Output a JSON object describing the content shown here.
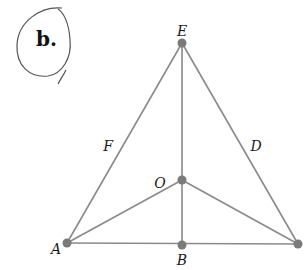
{
  "figure": {
    "tag": "b.",
    "points": [
      {
        "id": "E",
        "label": "E",
        "x": 182,
        "y": 43,
        "lx": 182,
        "ly": 34
      },
      {
        "id": "O",
        "label": "O",
        "x": 182,
        "y": 180,
        "lx": 160,
        "ly": 188
      },
      {
        "id": "B",
        "label": "B",
        "x": 182,
        "y": 245,
        "lx": 182,
        "ly": 266
      },
      {
        "id": "A",
        "label": "A",
        "x": 67,
        "y": 243,
        "lx": 55,
        "ly": 254
      },
      {
        "id": "C",
        "label": "",
        "x": 298,
        "y": 244,
        "lx": 0,
        "ly": 0
      }
    ],
    "edge_labels": [
      {
        "label": "F",
        "x": 108,
        "y": 151
      },
      {
        "label": "D",
        "x": 256,
        "y": 151
      }
    ],
    "colors": {
      "line": "#8a8a8a",
      "point": "#7a7a7a",
      "circle": "#555555"
    }
  }
}
